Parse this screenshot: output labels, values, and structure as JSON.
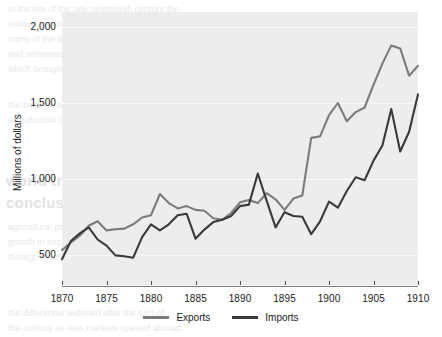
{
  "chart_data": {
    "type": "line",
    "title": "",
    "subtitle": "",
    "xlabel": "",
    "ylabel": "Millions of dollars",
    "xlim": [
      1870,
      1910
    ],
    "ylim": [
      300,
      2100
    ],
    "x_ticks": [
      1870,
      1875,
      1880,
      1885,
      1890,
      1895,
      1900,
      1905,
      1910
    ],
    "x_tick_labels": [
      "1870",
      "1875",
      "1880",
      "1885",
      "1890",
      "1895",
      "1900",
      "1905",
      "1910"
    ],
    "y_ticks": [
      500,
      1000,
      1500,
      2000
    ],
    "y_tick_labels": [
      "500",
      "1,000",
      "1,500",
      "2,000"
    ],
    "grid": "horizontal",
    "legend_position": "bottom-center",
    "x": [
      1870,
      1871,
      1872,
      1873,
      1874,
      1875,
      1876,
      1877,
      1878,
      1879,
      1880,
      1881,
      1882,
      1883,
      1884,
      1885,
      1886,
      1887,
      1888,
      1889,
      1890,
      1891,
      1892,
      1893,
      1894,
      1895,
      1896,
      1897,
      1898,
      1899,
      1900,
      1901,
      1902,
      1903,
      1904,
      1905,
      1906,
      1907,
      1908,
      1909,
      1910
    ],
    "series": [
      {
        "name": "Exports",
        "color": "#7c7c7c",
        "values": [
          530,
          580,
          625,
          690,
          720,
          660,
          668,
          672,
          700,
          745,
          760,
          900,
          840,
          805,
          820,
          795,
          790,
          740,
          730,
          775,
          845,
          860,
          840,
          905,
          865,
          795,
          870,
          890,
          1270,
          1280,
          1420,
          1500,
          1380,
          1440,
          1470,
          1620,
          1760,
          1880,
          1860,
          1680,
          1745
        ]
      },
      {
        "name": "Imports",
        "color": "#3a3a3a",
        "values": [
          470,
          590,
          640,
          680,
          600,
          560,
          495,
          490,
          480,
          615,
          700,
          660,
          700,
          760,
          770,
          605,
          665,
          715,
          730,
          755,
          820,
          830,
          1035,
          855,
          680,
          780,
          755,
          750,
          635,
          720,
          850,
          810,
          920,
          1010,
          990,
          1120,
          1220,
          1460,
          1180,
          1310,
          1557
        ]
      }
    ]
  },
  "legend": {
    "items": [
      {
        "label": "Exports",
        "color": "#7c7c7c"
      },
      {
        "label": "Imports",
        "color": "#3a3a3a"
      }
    ]
  },
  "background_text": {
    "heading_line_1": "world trade, and",
    "heading_line_2": "conclusion for policy",
    "lines": [
      "in the era of the late nineteenth century the",
      "relative importance of trade rose sharply for",
      "many of the leading economies of the world",
      "and remained high until the outbreak of war",
      "which brought a collapse in the global system",
      "the balance of trade shifted over this period",
      "as industrial output expanded faster than",
      "agricultural production in most regions",
      "growth in exports outpaced that of imports",
      "through much of the period under review",
      "the differential widened after the turn of",
      "the century as new markets opened abroad"
    ]
  }
}
